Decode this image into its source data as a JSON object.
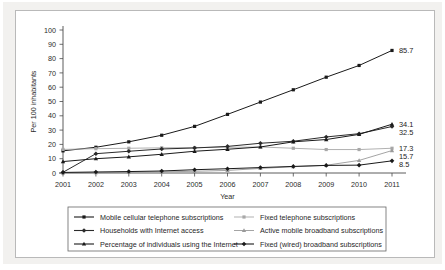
{
  "chart_data": {
    "type": "line",
    "title": "",
    "xlabel": "Year",
    "ylabel": "Per 100 inhabitants",
    "x": [
      2001,
      2002,
      2003,
      2004,
      2005,
      2006,
      2007,
      2008,
      2009,
      2010,
      2011
    ],
    "xtick_labels": [
      "2001",
      "2002",
      "2003",
      "2004",
      "2005",
      "2006",
      "2007",
      "2008",
      "2009",
      "2010",
      "2011"
    ],
    "ytick_labels": [
      "0",
      "10",
      "20",
      "30",
      "40",
      "50",
      "60",
      "70",
      "80",
      "90",
      "100"
    ],
    "ylim": [
      0,
      100
    ],
    "ytick_step": 10,
    "grid": false,
    "legend_position": "bottom",
    "series": [
      {
        "name": "Mobile cellular telephone subscriptions",
        "marker": "square",
        "color": "#1a1a1a",
        "values": [
          15.5,
          18.0,
          21.8,
          26.4,
          32.6,
          41.0,
          49.6,
          58.2,
          67.0,
          75.2,
          85.7
        ],
        "end_label": "85.7"
      },
      {
        "name": "Fixed telephone subscriptions",
        "marker": "square-light",
        "color": "#a8a8a8",
        "values": [
          16.5,
          17.0,
          17.3,
          17.6,
          17.8,
          18.0,
          18.2,
          17.3,
          16.4,
          16.4,
          17.3
        ],
        "end_label": "17.3"
      },
      {
        "name": "Households with Internet access",
        "marker": "diamond",
        "color": "#2b2b2b",
        "values": [
          0.5,
          13.5,
          15.2,
          16.8,
          17.5,
          18.6,
          20.8,
          22.2,
          25.2,
          27.5,
          32.5
        ],
        "end_label": "32.5"
      },
      {
        "name": "Active mobile broadband subscriptions",
        "marker": "triangle-light",
        "color": "#9a9a9a",
        "values": [
          0.0,
          0.2,
          0.5,
          0.8,
          1.2,
          1.8,
          3.2,
          4.4,
          5.4,
          8.8,
          15.7
        ],
        "end_label": "15.7"
      },
      {
        "name": "Percentage of individuals using the Internet",
        "marker": "triangle",
        "color": "#1a1a1a",
        "values": [
          8.0,
          10.0,
          11.3,
          13.1,
          15.2,
          16.6,
          18.2,
          21.8,
          23.4,
          27.0,
          34.1
        ],
        "end_label": "34.1"
      },
      {
        "name": "Fixed (wired) broadband subscriptions",
        "marker": "diamond-dark",
        "color": "#1a1a1a",
        "values": [
          0.4,
          0.7,
          1.0,
          1.4,
          2.3,
          3.0,
          3.8,
          4.6,
          5.3,
          5.5,
          8.5
        ],
        "end_label": "8.5"
      }
    ]
  },
  "legend": {
    "entries": [
      {
        "label": "Mobile cellular telephone subscriptions"
      },
      {
        "label": "Fixed telephone subscriptions"
      },
      {
        "label": "Households with Internet access"
      },
      {
        "label": "Active mobile broadband subscriptions"
      },
      {
        "label": "Percentage of individuals using the Internet"
      },
      {
        "label": "Fixed (wired) broadband subscriptions"
      }
    ]
  }
}
